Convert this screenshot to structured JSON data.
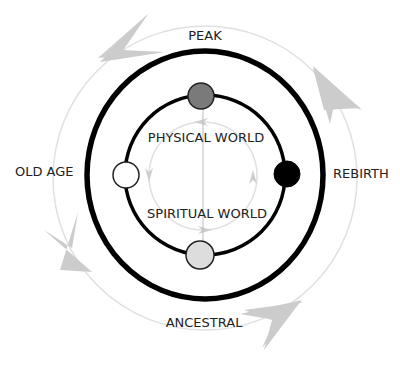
{
  "diagram": {
    "labels": {
      "peak": "PEAK",
      "rebirth": "REBIRTH",
      "old_age": "OLD AGE",
      "ancestral": "ANCESTRAL",
      "physical_world": "PHYSICAL WORLD",
      "spiritual_world": "SPIRITUAL WORLD"
    },
    "nodes": [
      {
        "id": "peak",
        "fill": "#7a7a7a"
      },
      {
        "id": "rebirth",
        "fill": "#000000"
      },
      {
        "id": "ancestral",
        "fill": "#dddddd"
      },
      {
        "id": "old-age",
        "fill": "#ffffff"
      }
    ],
    "colors": {
      "ring": "#000000",
      "faint_ring": "#dcdcdc",
      "arrow": "#c8c8c8",
      "text": "#222222"
    }
  }
}
